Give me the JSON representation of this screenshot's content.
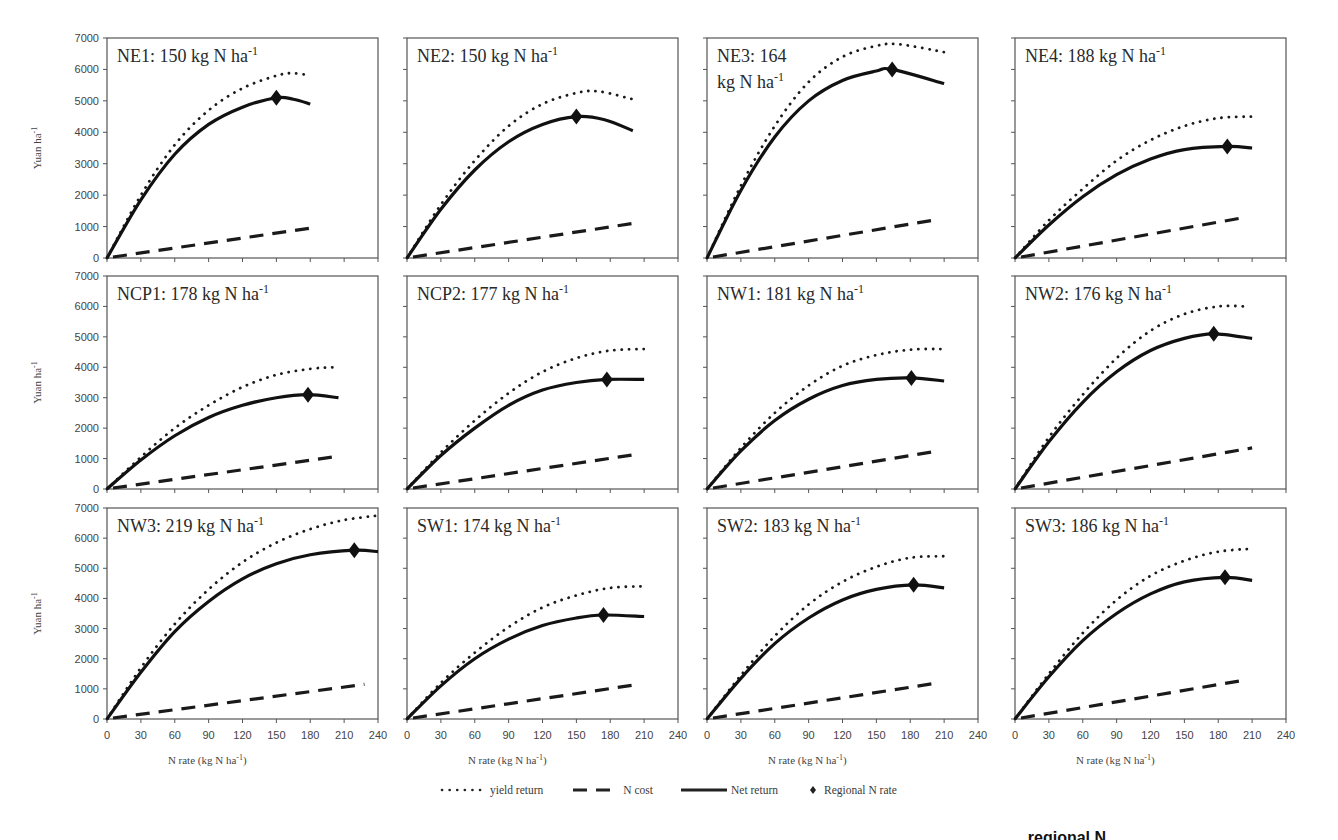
{
  "chart_data": {
    "type": "line",
    "layout": {
      "rows": 3,
      "cols": 4,
      "grid": false,
      "legend_position": "bottom-center"
    },
    "ylabel": "Yuan ha-1",
    "xlabel": "N rate (kg N ha-1)",
    "xlim": [
      0,
      240
    ],
    "ylim": [
      0,
      7000
    ],
    "xticks": [
      0,
      30,
      60,
      90,
      120,
      150,
      180,
      210,
      240
    ],
    "yticks": [
      0,
      1000,
      2000,
      3000,
      4000,
      5000,
      6000,
      7000
    ],
    "legend": [
      {
        "key": "yield",
        "label": "yield return",
        "style": "dotted"
      },
      {
        "key": "cost",
        "label": "N cost",
        "style": "dashed"
      },
      {
        "key": "net",
        "label": "Net return",
        "style": "solid"
      },
      {
        "key": "regional",
        "label": "Regional N rate",
        "style": "diamond-marker"
      }
    ],
    "panels": [
      {
        "id": "NE1",
        "title": "NE1: 150 kg N ha-1",
        "title_lines": [
          "NE1: 150 kg N ha",
          "-1"
        ],
        "regional_rate": 150,
        "x_end": 180,
        "yield": [
          [
            0,
            0
          ],
          [
            30,
            2000
          ],
          [
            60,
            3600
          ],
          [
            90,
            4700
          ],
          [
            120,
            5400
          ],
          [
            150,
            5800
          ],
          [
            165,
            5880
          ],
          [
            180,
            5800
          ]
        ],
        "net": [
          [
            0,
            0
          ],
          [
            30,
            1850
          ],
          [
            60,
            3300
          ],
          [
            90,
            4250
          ],
          [
            120,
            4800
          ],
          [
            150,
            5100
          ],
          [
            165,
            5050
          ],
          [
            180,
            4900
          ]
        ],
        "cost": [
          [
            0,
            0
          ],
          [
            180,
            950
          ]
        ],
        "regional_value": 5100
      },
      {
        "id": "NE2",
        "title": "NE2: 150 kg N ha-1",
        "title_lines": [
          "NE2: 150 kg N ha",
          "-1"
        ],
        "regional_rate": 150,
        "x_end": 200,
        "yield": [
          [
            0,
            0
          ],
          [
            30,
            1700
          ],
          [
            60,
            3100
          ],
          [
            90,
            4200
          ],
          [
            120,
            4900
          ],
          [
            150,
            5250
          ],
          [
            170,
            5300
          ],
          [
            200,
            5050
          ]
        ],
        "net": [
          [
            0,
            0
          ],
          [
            30,
            1550
          ],
          [
            60,
            2800
          ],
          [
            90,
            3700
          ],
          [
            120,
            4250
          ],
          [
            150,
            4500
          ],
          [
            175,
            4400
          ],
          [
            200,
            4050
          ]
        ],
        "cost": [
          [
            0,
            0
          ],
          [
            200,
            1100
          ]
        ],
        "regional_value": 4500
      },
      {
        "id": "NE3",
        "title": "NE3: 164 kg N ha-1",
        "title_lines": [
          "NE3: 164",
          "kg N ha",
          "-1"
        ],
        "regional_rate": 164,
        "x_end": 210,
        "yield": [
          [
            0,
            0
          ],
          [
            30,
            2300
          ],
          [
            60,
            4200
          ],
          [
            90,
            5600
          ],
          [
            120,
            6400
          ],
          [
            150,
            6750
          ],
          [
            170,
            6800
          ],
          [
            210,
            6550
          ]
        ],
        "net": [
          [
            0,
            0
          ],
          [
            30,
            2150
          ],
          [
            60,
            3850
          ],
          [
            90,
            5000
          ],
          [
            120,
            5650
          ],
          [
            150,
            5950
          ],
          [
            164,
            6000
          ],
          [
            210,
            5550
          ]
        ],
        "cost": [
          [
            0,
            0
          ],
          [
            200,
            1200
          ]
        ],
        "regional_value": 6000
      },
      {
        "id": "NE4",
        "title": "NE4: 188 kg N ha-1",
        "title_lines": [
          "NE4: 188 kg N ha",
          "-1"
        ],
        "regional_rate": 188,
        "x_end": 210,
        "yield": [
          [
            0,
            0
          ],
          [
            30,
            1200
          ],
          [
            60,
            2200
          ],
          [
            90,
            3100
          ],
          [
            120,
            3750
          ],
          [
            150,
            4200
          ],
          [
            180,
            4450
          ],
          [
            210,
            4500
          ]
        ],
        "net": [
          [
            0,
            0
          ],
          [
            30,
            1050
          ],
          [
            60,
            1950
          ],
          [
            90,
            2650
          ],
          [
            120,
            3150
          ],
          [
            150,
            3450
          ],
          [
            188,
            3550
          ],
          [
            210,
            3500
          ]
        ],
        "cost": [
          [
            0,
            0
          ],
          [
            205,
            1300
          ]
        ],
        "regional_value": 3550
      },
      {
        "id": "NCP1",
        "title": "NCP1: 178 kg N ha-1",
        "title_lines": [
          "NCP1: 178 kg N ha",
          "-1"
        ],
        "regional_rate": 178,
        "x_end": 205,
        "yield": [
          [
            0,
            0
          ],
          [
            30,
            1050
          ],
          [
            60,
            2000
          ],
          [
            90,
            2750
          ],
          [
            120,
            3350
          ],
          [
            150,
            3750
          ],
          [
            180,
            3950
          ],
          [
            200,
            4000
          ]
        ],
        "net": [
          [
            0,
            0
          ],
          [
            30,
            950
          ],
          [
            60,
            1750
          ],
          [
            90,
            2350
          ],
          [
            120,
            2750
          ],
          [
            150,
            3000
          ],
          [
            178,
            3100
          ],
          [
            205,
            3000
          ]
        ],
        "cost": [
          [
            0,
            0
          ],
          [
            200,
            1050
          ]
        ],
        "regional_value": 3100
      },
      {
        "id": "NCP2",
        "title": "NCP2: 177 kg N ha-1",
        "title_lines": [
          "NCP2: 177 kg N ha",
          "-1"
        ],
        "regional_rate": 177,
        "x_end": 210,
        "yield": [
          [
            0,
            0
          ],
          [
            30,
            1200
          ],
          [
            60,
            2250
          ],
          [
            90,
            3150
          ],
          [
            120,
            3850
          ],
          [
            150,
            4300
          ],
          [
            180,
            4550
          ],
          [
            210,
            4600
          ]
        ],
        "net": [
          [
            0,
            0
          ],
          [
            30,
            1100
          ],
          [
            60,
            2000
          ],
          [
            90,
            2750
          ],
          [
            120,
            3250
          ],
          [
            150,
            3500
          ],
          [
            177,
            3600
          ],
          [
            210,
            3600
          ]
        ],
        "cost": [
          [
            0,
            0
          ],
          [
            205,
            1150
          ]
        ],
        "regional_value": 3600
      },
      {
        "id": "NW1",
        "title": "NW1: 181 kg N ha-1",
        "title_lines": [
          "NW1: 181 kg N ha",
          "-1"
        ],
        "regional_rate": 181,
        "x_end": 210,
        "yield": [
          [
            0,
            0
          ],
          [
            30,
            1350
          ],
          [
            60,
            2500
          ],
          [
            90,
            3400
          ],
          [
            120,
            4050
          ],
          [
            150,
            4400
          ],
          [
            180,
            4580
          ],
          [
            210,
            4600
          ]
        ],
        "net": [
          [
            0,
            0
          ],
          [
            30,
            1250
          ],
          [
            60,
            2250
          ],
          [
            90,
            2950
          ],
          [
            120,
            3400
          ],
          [
            150,
            3600
          ],
          [
            181,
            3650
          ],
          [
            210,
            3550
          ]
        ],
        "cost": [
          [
            0,
            0
          ],
          [
            205,
            1250
          ]
        ],
        "regional_value": 3650
      },
      {
        "id": "NW2",
        "title": "NW2: 176 kg N ha-1",
        "title_lines": [
          "NW2: 176 kg N ha",
          "-1"
        ],
        "regional_rate": 176,
        "x_end": 210,
        "yield": [
          [
            0,
            0
          ],
          [
            30,
            1700
          ],
          [
            60,
            3100
          ],
          [
            90,
            4300
          ],
          [
            120,
            5200
          ],
          [
            150,
            5750
          ],
          [
            180,
            6000
          ],
          [
            205,
            6000
          ]
        ],
        "net": [
          [
            0,
            0
          ],
          [
            30,
            1550
          ],
          [
            60,
            2850
          ],
          [
            90,
            3850
          ],
          [
            120,
            4550
          ],
          [
            150,
            4950
          ],
          [
            176,
            5100
          ],
          [
            210,
            4950
          ]
        ],
        "cost": [
          [
            0,
            0
          ],
          [
            210,
            1350
          ]
        ],
        "regional_value": 5100
      },
      {
        "id": "NW3",
        "title": "NW3: 219 kg N ha-1",
        "title_lines": [
          "NW3: 219 kg N ha",
          "-1"
        ],
        "regional_rate": 219,
        "x_end": 240,
        "yield": [
          [
            0,
            0
          ],
          [
            30,
            1700
          ],
          [
            60,
            3150
          ],
          [
            90,
            4300
          ],
          [
            120,
            5200
          ],
          [
            150,
            5850
          ],
          [
            180,
            6300
          ],
          [
            210,
            6600
          ],
          [
            240,
            6750
          ]
        ],
        "net": [
          [
            0,
            0
          ],
          [
            30,
            1550
          ],
          [
            60,
            2900
          ],
          [
            90,
            3900
          ],
          [
            120,
            4650
          ],
          [
            150,
            5150
          ],
          [
            180,
            5450
          ],
          [
            219,
            5600
          ],
          [
            240,
            5550
          ]
        ],
        "cost": [
          [
            0,
            0
          ],
          [
            228,
            1150
          ]
        ],
        "regional_value": 5600
      },
      {
        "id": "SW1",
        "title": "SW1: 174 kg N ha-1",
        "title_lines": [
          "SW1: 174 kg N ha",
          "-1"
        ],
        "regional_rate": 174,
        "x_end": 210,
        "yield": [
          [
            0,
            0
          ],
          [
            30,
            1200
          ],
          [
            60,
            2200
          ],
          [
            90,
            3050
          ],
          [
            120,
            3700
          ],
          [
            150,
            4100
          ],
          [
            180,
            4350
          ],
          [
            210,
            4400
          ]
        ],
        "net": [
          [
            0,
            0
          ],
          [
            30,
            1100
          ],
          [
            60,
            2000
          ],
          [
            90,
            2650
          ],
          [
            120,
            3100
          ],
          [
            150,
            3350
          ],
          [
            174,
            3450
          ],
          [
            210,
            3400
          ]
        ],
        "cost": [
          [
            0,
            0
          ],
          [
            205,
            1150
          ]
        ],
        "regional_value": 3450
      },
      {
        "id": "SW2",
        "title": "SW2: 183 kg N ha-1",
        "title_lines": [
          "SW2: 183 kg N ha",
          "-1"
        ],
        "regional_rate": 183,
        "x_end": 210,
        "yield": [
          [
            0,
            0
          ],
          [
            30,
            1450
          ],
          [
            60,
            2750
          ],
          [
            90,
            3800
          ],
          [
            120,
            4550
          ],
          [
            150,
            5050
          ],
          [
            180,
            5350
          ],
          [
            210,
            5400
          ]
        ],
        "net": [
          [
            0,
            0
          ],
          [
            30,
            1350
          ],
          [
            60,
            2500
          ],
          [
            90,
            3350
          ],
          [
            120,
            3950
          ],
          [
            150,
            4300
          ],
          [
            183,
            4450
          ],
          [
            210,
            4350
          ]
        ],
        "cost": [
          [
            0,
            0
          ],
          [
            205,
            1200
          ]
        ],
        "regional_value": 4450
      },
      {
        "id": "SW3",
        "title": "SW3: 186 kg N ha-1",
        "title_lines": [
          "SW3: 186 kg N ha",
          "-1"
        ],
        "regional_rate": 186,
        "x_end": 210,
        "yield": [
          [
            0,
            0
          ],
          [
            30,
            1500
          ],
          [
            60,
            2850
          ],
          [
            90,
            3950
          ],
          [
            120,
            4750
          ],
          [
            150,
            5250
          ],
          [
            180,
            5550
          ],
          [
            210,
            5650
          ]
        ],
        "net": [
          [
            0,
            0
          ],
          [
            30,
            1400
          ],
          [
            60,
            2600
          ],
          [
            90,
            3500
          ],
          [
            120,
            4150
          ],
          [
            150,
            4550
          ],
          [
            186,
            4700
          ],
          [
            210,
            4600
          ]
        ],
        "cost": [
          [
            0,
            0
          ],
          [
            205,
            1300
          ]
        ],
        "regional_value": 4700
      }
    ]
  },
  "axis_labels": {
    "ylabel_main": "Yuan ha",
    "ylabel_sup": "-1",
    "xlabel_main": "N rate (kg N ha",
    "xlabel_sup": "-1",
    "xlabel_close": ")"
  },
  "legend": {
    "yield": "yield return",
    "cost": "N cost",
    "net": "Net return",
    "regional": "Regional N rate"
  },
  "caption_fragment": "... regional N"
}
